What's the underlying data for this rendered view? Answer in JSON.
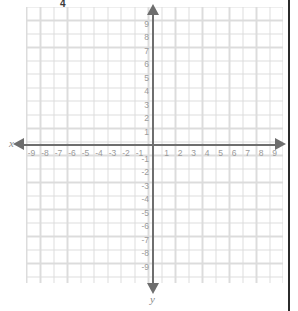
{
  "figure": {
    "type": "coordinate-plane",
    "top_mark": "4",
    "x_axis_label": "x",
    "y_axis_label": "y"
  },
  "chart_data": {
    "type": "scatter",
    "title": "",
    "subtitle": "",
    "xlabel": "x",
    "ylabel": "y",
    "xlim": [
      -9.5,
      9.5
    ],
    "ylim": [
      -9.5,
      9.5
    ],
    "grid": true,
    "legend": "none",
    "series": [],
    "annotations": [
      "4"
    ],
    "x_ticks": [
      -9,
      -8,
      -7,
      -6,
      -5,
      -4,
      -3,
      -2,
      -1,
      1,
      2,
      3,
      4,
      5,
      6,
      7,
      8,
      9
    ],
    "y_ticks": [
      9,
      8,
      7,
      6,
      5,
      4,
      3,
      2,
      1,
      -1,
      -2,
      -3,
      -4,
      -5,
      -6,
      -7,
      -8,
      -9
    ],
    "x_tick_labels": [
      "-9",
      "-8",
      "-7",
      "-6",
      "-5",
      "-4",
      "-3",
      "-2",
      "-1",
      "1",
      "2",
      "3",
      "4",
      "5",
      "6",
      "7",
      "8",
      "9"
    ],
    "y_tick_labels": [
      "9",
      "8",
      "7",
      "6",
      "5",
      "4",
      "3",
      "2",
      "1",
      "-1",
      "-2",
      "-3",
      "-4",
      "-5",
      "-6",
      "-7",
      "-8",
      "-9"
    ],
    "origin": [
      0,
      0
    ],
    "grid_step": 1,
    "arrows": [
      "left",
      "right",
      "up",
      "down"
    ]
  },
  "colors": {
    "grid": "#dcdcdc",
    "axis": "#6e6e6e",
    "tick_text": "#9a9a9a",
    "axis_label": "#8a8a8a",
    "mark_text": "#3a3a3a",
    "border": "#2b2b2b",
    "background": "#ffffff"
  }
}
